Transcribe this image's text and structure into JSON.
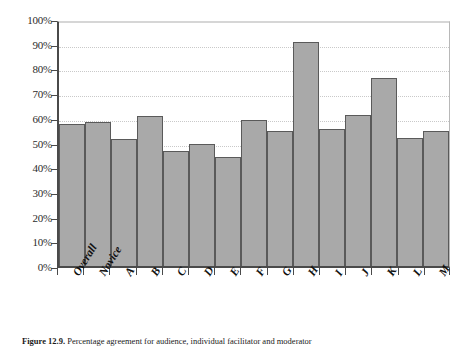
{
  "chart_data": {
    "type": "bar",
    "title": "",
    "xlabel": "",
    "ylabel": "",
    "ylim": [
      0,
      100
    ],
    "grid": true,
    "legend": "none",
    "categories": [
      "Overall",
      "Novice",
      "A",
      "B",
      "C",
      "D",
      "E",
      "F",
      "G",
      "H",
      "I",
      "J",
      "K",
      "L",
      "M"
    ],
    "values": [
      58,
      59,
      52,
      61.5,
      47,
      50,
      44.5,
      60,
      55.5,
      92,
      56,
      62,
      77,
      52.5,
      55.5
    ],
    "y_tick_labels": [
      "0%",
      "10%",
      "20%",
      "30%",
      "40%",
      "50%",
      "60%",
      "70%",
      "80%",
      "90%",
      "100%"
    ],
    "y_tick_values": [
      0,
      10,
      20,
      30,
      40,
      50,
      60,
      70,
      80,
      90,
      100
    ],
    "bar_fill_color": "#a9a9a9",
    "bar_border_color": "#5a5a5a",
    "axis_color": "#4a4a4a",
    "gridline_color": "#c9c9c9"
  },
  "caption": {
    "number": "Figure 12.9.",
    "text": " Percentage agreement for audience, individual facilitator and moderator"
  }
}
